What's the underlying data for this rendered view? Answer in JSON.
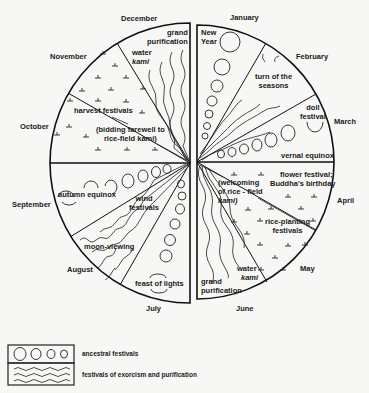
{
  "months": {
    "december": "December",
    "january": "January",
    "november": "November",
    "february": "February",
    "october": "October",
    "march": "March",
    "september": "September",
    "april": "April",
    "august": "August",
    "may": "May",
    "july": "July",
    "june": "June"
  },
  "festivals": {
    "grand_purification_dec_1": "grand",
    "grand_purification_dec_2": "purification",
    "water_kami_dec_1": "water",
    "water_kami_dec_2": "kami",
    "new_year_1": "New",
    "new_year_2": "Year",
    "turn_seasons_1": "turn of the",
    "turn_seasons_2": "seasons",
    "doll_festival_1": "doll",
    "doll_festival_2": "festival",
    "vernal_equinox": "vernal equinox",
    "flower_festival_1": "flower festival;",
    "flower_festival_2": "Buddha's birthday",
    "welcoming_1": "(welcoming",
    "welcoming_2": "of rice - field",
    "welcoming_3": "kami)",
    "rice_planting_1": "rice-planting",
    "rice_planting_2": "festivals",
    "water_kami_jun_1": "water",
    "water_kami_jun_2": "kami",
    "grand_purification_jun_1": "grand",
    "grand_purification_jun_2": "purification",
    "harvest_festivals": "harvest festivals",
    "bidding_farewell_1": "(bidding farewell to",
    "bidding_farewell_2": "rice-field kami)",
    "autumn_equinox": "autumn equinox",
    "wind_festivals_1": "wind",
    "wind_festivals_2": "festivals",
    "moon_viewing": "moon-viewing",
    "feast_of_lights": "feast of lights"
  },
  "legend": {
    "ancestral": "ancestral festivals",
    "exorcism": "festivals of exorcism and purification"
  }
}
